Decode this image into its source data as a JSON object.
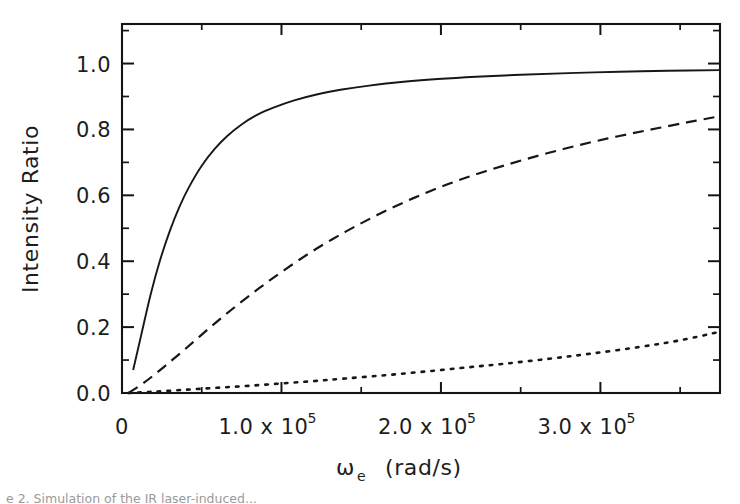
{
  "figure": {
    "background": "#ffffff",
    "ink_color": "#171717"
  },
  "caption": {
    "text": "e 2. Simulation of the IR laser-induced..."
  },
  "chart_data": {
    "type": "line",
    "title": "",
    "subtitle": "",
    "xlabel": "ωe  (rad/s)",
    "xlabel_symbol": "ω",
    "xlabel_subscript": "e",
    "xlabel_units": "(rad/s)",
    "ylabel": "Intensity Ratio",
    "xlim": [
      0,
      375000
    ],
    "ylim": [
      0,
      1.12
    ],
    "grid": false,
    "legend": "none",
    "x_ticks": [
      {
        "value": 0,
        "label": "0",
        "mantissa": "0",
        "exponent": ""
      },
      {
        "value": 100000,
        "label": "1.0 x 10^5",
        "mantissa": "1.0 x 10",
        "exponent": "5"
      },
      {
        "value": 200000,
        "label": "2.0 x 10^5",
        "mantissa": "2.0 x 10",
        "exponent": "5"
      },
      {
        "value": 300000,
        "label": "3.0 x 10^5",
        "mantissa": "3.0 x 10",
        "exponent": "5"
      }
    ],
    "x_minor_step": 50000,
    "y_ticks": [
      {
        "value": 0.0,
        "label": "0.0"
      },
      {
        "value": 0.2,
        "label": "0.2"
      },
      {
        "value": 0.4,
        "label": "0.4"
      },
      {
        "value": 0.6,
        "label": "0.6"
      },
      {
        "value": 0.8,
        "label": "0.8"
      },
      {
        "value": 1.0,
        "label": "1.0"
      }
    ],
    "y_minor_step": 0.1,
    "series": [
      {
        "name": "solid-curve",
        "style": "solid",
        "x": [
          7000,
          12000,
          18000,
          24000,
          30000,
          36000,
          42000,
          50000,
          58000,
          66000,
          75000,
          85000,
          95000,
          108000,
          122000,
          138000,
          155000,
          175000,
          198000,
          222000,
          250000,
          280000,
          312000,
          342000,
          375000
        ],
        "y": [
          0.07,
          0.175,
          0.3,
          0.405,
          0.492,
          0.565,
          0.625,
          0.69,
          0.74,
          0.78,
          0.815,
          0.845,
          0.866,
          0.888,
          0.906,
          0.921,
          0.933,
          0.944,
          0.953,
          0.96,
          0.966,
          0.971,
          0.975,
          0.978,
          0.98
        ]
      },
      {
        "name": "dashed-curve",
        "style": "dashed",
        "x": [
          4000,
          14000,
          26000,
          40000,
          55000,
          70000,
          86000,
          102000,
          120000,
          140000,
          160000,
          182000,
          205000,
          228000,
          252000,
          278000,
          304000,
          330000,
          355000,
          375000
        ],
        "y": [
          0.0,
          0.032,
          0.078,
          0.135,
          0.198,
          0.258,
          0.318,
          0.374,
          0.432,
          0.489,
          0.54,
          0.59,
          0.635,
          0.673,
          0.708,
          0.742,
          0.772,
          0.798,
          0.822,
          0.84
        ]
      },
      {
        "name": "dotted-curve",
        "style": "dotted",
        "x": [
          4000,
          20000,
          40000,
          60000,
          80000,
          100000,
          120000,
          140000,
          165000,
          190000,
          215000,
          240000,
          268000,
          295000,
          325000,
          350000,
          375000
        ],
        "y": [
          0.0,
          0.004,
          0.01,
          0.016,
          0.022,
          0.029,
          0.036,
          0.044,
          0.054,
          0.065,
          0.077,
          0.089,
          0.104,
          0.12,
          0.14,
          0.16,
          0.186
        ]
      }
    ]
  }
}
